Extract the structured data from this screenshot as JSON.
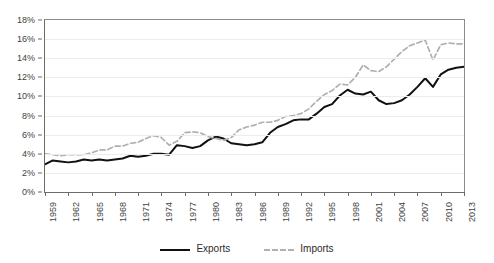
{
  "chart_data": {
    "type": "line",
    "title": "",
    "subtitle": "",
    "xlabel": "",
    "ylabel": "",
    "ylim": [
      0,
      18
    ],
    "ytick_values": [
      0,
      2,
      4,
      6,
      8,
      10,
      12,
      14,
      16,
      18
    ],
    "ytick_labels": [
      "0%",
      "2%",
      "4%",
      "6%",
      "8%",
      "10%",
      "12%",
      "14%",
      "16%",
      "18%"
    ],
    "xlim": [
      1959,
      2013
    ],
    "xtick_values": [
      1959,
      1962,
      1965,
      1968,
      1971,
      1974,
      1977,
      1980,
      1983,
      1986,
      1989,
      1992,
      1995,
      1998,
      2001,
      2004,
      2007,
      2010,
      2013
    ],
    "xtick_labels": [
      "1959",
      "1962",
      "1965",
      "1968",
      "1971",
      "1974",
      "1977",
      "1980",
      "1983",
      "1986",
      "1989",
      "1992",
      "1995",
      "1998",
      "2001",
      "2004",
      "2007",
      "2010",
      "2013"
    ],
    "grid": true,
    "legend_position": "bottom",
    "x": [
      1959,
      1960,
      1961,
      1962,
      1963,
      1964,
      1965,
      1966,
      1967,
      1968,
      1969,
      1970,
      1971,
      1972,
      1973,
      1974,
      1975,
      1976,
      1977,
      1978,
      1979,
      1980,
      1981,
      1982,
      1983,
      1984,
      1985,
      1986,
      1987,
      1988,
      1989,
      1990,
      1991,
      1992,
      1993,
      1994,
      1995,
      1996,
      1997,
      1998,
      1999,
      2000,
      2001,
      2002,
      2003,
      2004,
      2005,
      2006,
      2007,
      2008,
      2009,
      2010,
      2011,
      2012,
      2013
    ],
    "series": [
      {
        "name": "Exports",
        "style": "solid",
        "color": "#111111",
        "values": [
          2.9,
          3.3,
          3.2,
          3.1,
          3.2,
          3.4,
          3.3,
          3.4,
          3.3,
          3.4,
          3.5,
          3.8,
          3.7,
          3.8,
          4.0,
          4.0,
          3.9,
          4.9,
          4.8,
          4.6,
          4.8,
          5.4,
          5.8,
          5.6,
          5.1,
          5.0,
          4.9,
          5.0,
          5.2,
          6.2,
          6.8,
          7.1,
          7.5,
          7.6,
          7.6,
          8.2,
          8.9,
          9.2,
          10.1,
          10.7,
          10.3,
          10.2,
          10.5,
          9.6,
          9.2,
          9.3,
          9.6,
          10.2,
          11.0,
          11.9,
          11.0,
          12.3,
          12.8,
          13.0,
          13.1
        ],
        "first_value": 2.9,
        "last_value": 13.1,
        "max_value": 13.1,
        "min_value": 2.9
      },
      {
        "name": "Imports",
        "style": "dashed",
        "color": "#b0b0b0",
        "values": [
          4.0,
          3.9,
          3.8,
          3.9,
          3.9,
          3.9,
          4.1,
          4.4,
          4.4,
          4.8,
          4.8,
          5.1,
          5.2,
          5.6,
          5.9,
          5.7,
          4.9,
          5.3,
          6.2,
          6.3,
          6.2,
          5.8,
          5.6,
          5.4,
          5.7,
          6.5,
          6.8,
          7.0,
          7.3,
          7.3,
          7.5,
          7.9,
          8.0,
          8.2,
          8.7,
          9.5,
          10.2,
          10.6,
          11.3,
          11.2,
          12.0,
          13.3,
          12.7,
          12.6,
          13.1,
          13.9,
          14.7,
          15.3,
          15.6,
          15.9,
          13.8,
          15.4,
          15.6,
          15.5,
          15.5
        ],
        "first_value": 4.0,
        "last_value": 15.5,
        "max_value": 15.9,
        "min_value": 3.8
      }
    ]
  },
  "legend": {
    "entries": [
      {
        "label": "Exports",
        "icon": "solid-line-swatch"
      },
      {
        "label": "Imports",
        "icon": "dashed-line-swatch"
      }
    ]
  },
  "colors": {
    "exports": "#111111",
    "imports": "#b0b0b0",
    "grid": "#ececec",
    "axis": "#6b6b6b",
    "background": "#ffffff",
    "text": "#3f3f3f"
  }
}
